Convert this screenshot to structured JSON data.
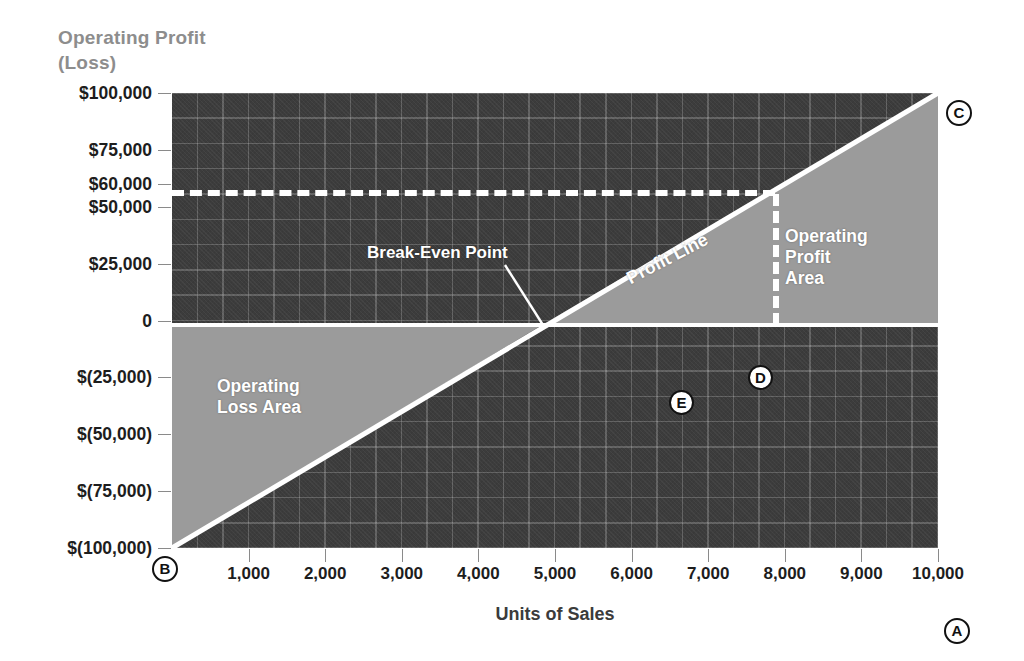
{
  "chart_data": {
    "type": "line",
    "title": "",
    "ylabel_line1": "Operating Profit",
    "ylabel_line2": "(Loss)",
    "xlabel": "Units of Sales",
    "x": [
      0,
      1000,
      2000,
      3000,
      4000,
      5000,
      6000,
      7000,
      8000,
      9000,
      10000
    ],
    "xlim": [
      0,
      10000
    ],
    "ylim": [
      -100000,
      100000
    ],
    "xticks": [
      "1,000",
      "2,000",
      "3,000",
      "4,000",
      "5,000",
      "6,000",
      "7,000",
      "8,000",
      "9,000",
      "10,000"
    ],
    "xtick_values": [
      1000,
      2000,
      3000,
      4000,
      5000,
      6000,
      7000,
      8000,
      9000,
      10000
    ],
    "yticks": [
      "$100,000",
      "$75,000",
      "$60,000",
      "$50,000",
      "$25,000",
      "0",
      "$(25,000)",
      "$(50,000)",
      "$(75,000)",
      "$(100,000)"
    ],
    "ytick_values": [
      100000,
      75000,
      60000,
      50000,
      25000,
      0,
      -25000,
      -50000,
      -75000,
      -100000
    ],
    "grid": true,
    "legend": "none",
    "series": [
      {
        "name": "Profit Line",
        "values": [
          -100000,
          -80000,
          -60000,
          -40000,
          -20000,
          0,
          20000,
          40000,
          60000,
          80000,
          100000
        ]
      }
    ],
    "break_even": {
      "units": 5000,
      "profit": 0
    },
    "reference_lines": [
      {
        "name": "profit-at-8000-horizontal",
        "orientation": "horizontal",
        "value": 60000,
        "style": "dashed",
        "from_x": 0,
        "to_x": 8000
      },
      {
        "name": "units-8000-vertical",
        "orientation": "vertical",
        "value": 8000,
        "style": "dashed",
        "from_y": 0,
        "to_y": 60000
      }
    ],
    "regions": [
      {
        "name": "Operating Profit Area",
        "fill": "#9b9b9b"
      },
      {
        "name": "Operating Loss Area",
        "fill": "#9b9b9b"
      }
    ],
    "annotations": [
      {
        "name": "break-even-point",
        "text": "Break-Even Point",
        "points_to_units": 5000,
        "points_to_profit": 0
      },
      {
        "name": "profit-line",
        "text": "Profit Line"
      },
      {
        "name": "operating-profit-area",
        "text": "Operating\nProfit\nArea"
      },
      {
        "name": "operating-loss-area",
        "text": "Operating\nLoss Area"
      }
    ],
    "callout_markers": [
      {
        "id": "A",
        "meaning": "x-axis end"
      },
      {
        "id": "B",
        "meaning": "plot origin"
      },
      {
        "id": "C",
        "meaning": "profit line end"
      },
      {
        "id": "D",
        "meaning": "profit line"
      },
      {
        "id": "E",
        "meaning": "break-even point"
      }
    ]
  },
  "labels": {
    "ylabel_line1": "Operating Profit",
    "ylabel_line2": "(Loss)",
    "xlabel": "Units of Sales",
    "break_even": "Break-Even Point",
    "profit_line": "Profit Line",
    "profit_area_line1": "Operating",
    "profit_area_line2": "Profit",
    "profit_area_line3": "Area",
    "loss_area_line1": "Operating",
    "loss_area_line2": "Loss Area"
  },
  "markers": {
    "a": "A",
    "b": "B",
    "c": "C",
    "d": "D",
    "e": "E"
  },
  "colors": {
    "plot_background": "#3c3c3c",
    "region_fill": "#9b9b9b",
    "line": "#ffffff",
    "tick_text": "#1d1d1d",
    "axis_title_y": "#8d8d8d",
    "axis_title_x": "#3b3b3b",
    "page_background": "#ffffff"
  }
}
